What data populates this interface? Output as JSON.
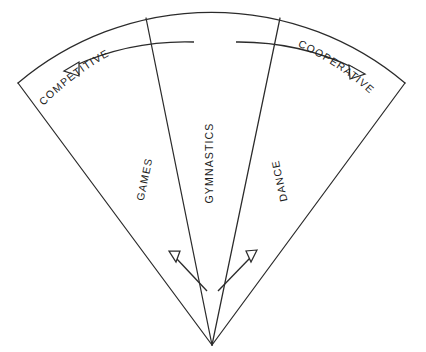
{
  "figure": {
    "type": "radial-fan-diagram",
    "background_color": "#ffffff",
    "stroke_color": "#2b2b2b",
    "text_color": "#1d1d1d",
    "width": 426,
    "height": 352
  },
  "sectors": [
    {
      "label": "GAMES",
      "position": "left"
    },
    {
      "label": "GYMNASTICS",
      "position": "center"
    },
    {
      "label": "DANCE",
      "position": "right"
    }
  ],
  "axis": {
    "left_label": "COMPETITIVE",
    "right_label": "COOPERATIVE",
    "left_arrow_direction": "left",
    "right_arrow_direction": "right"
  },
  "inner_arrows": [
    {
      "name": "left-inner-arrow",
      "direction": "outward-left"
    },
    {
      "name": "right-inner-arrow",
      "direction": "outward-right"
    }
  ]
}
